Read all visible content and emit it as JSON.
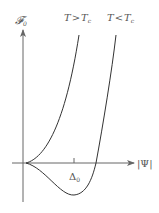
{
  "diagram": {
    "y_axis_label": "𝓕",
    "y_axis_subscript": "0",
    "x_axis_label": "|Ψ|",
    "minimum_label": "Δ",
    "minimum_subscript": "0",
    "curves": [
      {
        "name": "above-critical",
        "label_T": "T",
        "label_rel": ">",
        "label_Tc": "T",
        "label_sub": "c"
      },
      {
        "name": "below-critical",
        "label_T": "T",
        "label_rel": "<",
        "label_Tc": "T",
        "label_sub": "c"
      }
    ],
    "colors": {
      "line": "#333333",
      "text": "#555555",
      "axis": "#666666"
    }
  }
}
